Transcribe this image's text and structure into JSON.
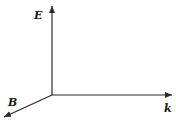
{
  "diagram": {
    "title": "",
    "axes": [
      {
        "id": "E",
        "label": "E",
        "direction": "up"
      },
      {
        "id": "k",
        "label": "k",
        "direction": "right"
      },
      {
        "id": "B",
        "label": "B",
        "direction": "down-left"
      }
    ],
    "colors": {
      "line": "#2a2a2a",
      "background": "#ffffff"
    }
  }
}
